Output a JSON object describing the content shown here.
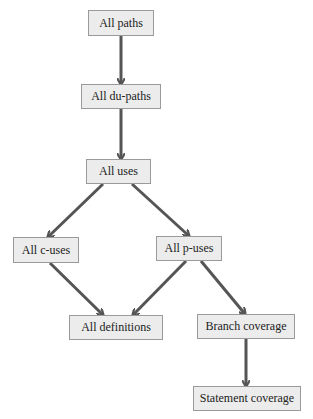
{
  "diagram": {
    "type": "subsumption hierarchy",
    "colors": {
      "node_fill": "#ececec",
      "node_border": "#9a9a9a",
      "arrow": "#555555",
      "text": "#222222",
      "background": "#ffffff"
    },
    "nodes": {
      "all_paths": {
        "label": "All paths",
        "x": 88,
        "y": 10,
        "w": 66,
        "h": 26
      },
      "all_du_paths": {
        "label": "All du-paths",
        "x": 81,
        "y": 84,
        "w": 80,
        "h": 25
      },
      "all_uses": {
        "label": "All uses",
        "x": 86,
        "y": 159,
        "w": 65,
        "h": 25
      },
      "all_c_uses": {
        "label": "All c-uses",
        "x": 13,
        "y": 237,
        "w": 66,
        "h": 26
      },
      "all_p_uses": {
        "label": "All p-uses",
        "x": 156,
        "y": 236,
        "w": 66,
        "h": 25
      },
      "all_definitions": {
        "label": "All definitions",
        "x": 69,
        "y": 315,
        "w": 94,
        "h": 25
      },
      "branch_coverage": {
        "label": "Branch coverage",
        "x": 197,
        "y": 314,
        "w": 98,
        "h": 25
      },
      "statement_coverage": {
        "label": "Statement coverage",
        "x": 193,
        "y": 386,
        "w": 108,
        "h": 25
      }
    },
    "edges": [
      {
        "from": "All paths",
        "to": "All du-paths",
        "x1": 121,
        "y1": 36,
        "x2": 121,
        "y2": 84
      },
      {
        "from": "All du-paths",
        "to": "All uses",
        "x1": 121,
        "y1": 109,
        "x2": 121,
        "y2": 159
      },
      {
        "from": "All uses",
        "to": "All c-uses",
        "x1": 103,
        "y1": 184,
        "x2": 48,
        "y2": 237
      },
      {
        "from": "All uses",
        "to": "All p-uses",
        "x1": 132,
        "y1": 184,
        "x2": 189,
        "y2": 236
      },
      {
        "from": "All c-uses",
        "to": "All definitions",
        "x1": 50,
        "y1": 263,
        "x2": 103,
        "y2": 315
      },
      {
        "from": "All p-uses",
        "to": "All definitions",
        "x1": 186,
        "y1": 261,
        "x2": 133,
        "y2": 315
      },
      {
        "from": "All p-uses",
        "to": "Branch coverage",
        "x1": 201,
        "y1": 261,
        "x2": 245,
        "y2": 314
      },
      {
        "from": "Branch coverage",
        "to": "Statement coverage",
        "x1": 246,
        "y1": 339,
        "x2": 246,
        "y2": 386
      }
    ]
  }
}
